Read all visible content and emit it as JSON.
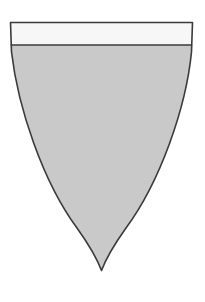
{
  "figure": {
    "name": "heraldic-shield",
    "canvas": {
      "width": 205,
      "height": 302,
      "background": "#ffffff"
    }
  },
  "colors": {
    "background": "#ffffff",
    "field_fill": "#c9c9c9",
    "chief_fill": "#f7f7f7",
    "outline": "#3a3a3a",
    "divider": "#3a3a3a"
  },
  "geometry": {
    "top_y": 21,
    "left_x": 9,
    "right_x": 193,
    "chief_bottom_y": 45,
    "point_x": 101,
    "point_y": 272,
    "stroke_width": 1.6,
    "shield_outline_path": "M 10.5 22.5 L 192.5 22.5 L 191.5 52 C 186 108 160 182 126 228 C 116 242 107 256 101.5 270.5 C 96 256 87 242 77 228 C 43 182 18 108 11.5 52 Z",
    "chief_path": "M 10.5 22.5 L 192.5 22.5 L 192.0 45.0 L 10.9 45.0 C 10.4 37 10.2 29 10.5 22.5 Z",
    "field_path": "M 10.9 45.0 L 192.0 45.0 L 191.5 52 C 186 108 160 182 126 228 C 116 242 107 256 101.5 270.5 C 96 256 87 242 77 228 C 43 182 18 108 11.5 52 Z",
    "divider_line": {
      "x1": 10.6,
      "y1": 45.0,
      "x2": 192.1,
      "y2": 45.0
    }
  },
  "parts": [
    {
      "id": "chief",
      "label": "Chief",
      "fill": "#f7f7f7"
    },
    {
      "id": "field",
      "label": "Field",
      "fill": "#c9c9c9"
    }
  ]
}
